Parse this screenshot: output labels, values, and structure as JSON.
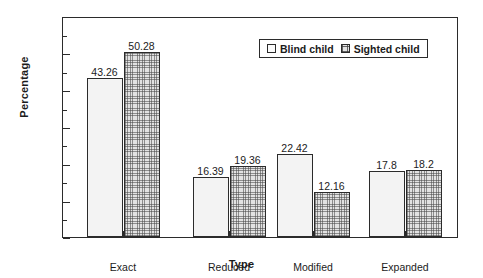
{
  "chart_data": {
    "type": "bar",
    "title": "",
    "xlabel": "Type",
    "ylabel": "Percentage",
    "categories": [
      "Exact",
      "Reduced",
      "Modified",
      "Expanded"
    ],
    "series": [
      {
        "name": "Blind child",
        "values": [
          43.26,
          16.39,
          22.42,
          17.8
        ]
      },
      {
        "name": "Sighted child",
        "values": [
          50.28,
          19.36,
          12.16,
          18.2
        ]
      }
    ],
    "value_labels": [
      [
        "43.26",
        "16.39",
        "22.42",
        "17.8"
      ],
      [
        "50.28",
        "19.36",
        "12.16",
        "18.2"
      ]
    ],
    "ylim": [
      0,
      60
    ],
    "yticks": [
      0,
      10,
      20,
      30,
      40,
      50,
      60
    ],
    "ytick_labels": [
      "0",
      "10",
      "20",
      "30",
      "40",
      "50",
      "60"
    ],
    "yminor_ticks": [
      5,
      15,
      25,
      35,
      45,
      55
    ],
    "grid": false,
    "legend_position": "top-center",
    "legend": [
      "Blind child",
      "Sighted child"
    ],
    "colors": {
      "blind_fill": "#f3f3f3",
      "sighted_fill": "#e2e2e2",
      "outline": "#2b2b2b",
      "text": "#1b1b1b",
      "background": "#ffffff"
    }
  }
}
